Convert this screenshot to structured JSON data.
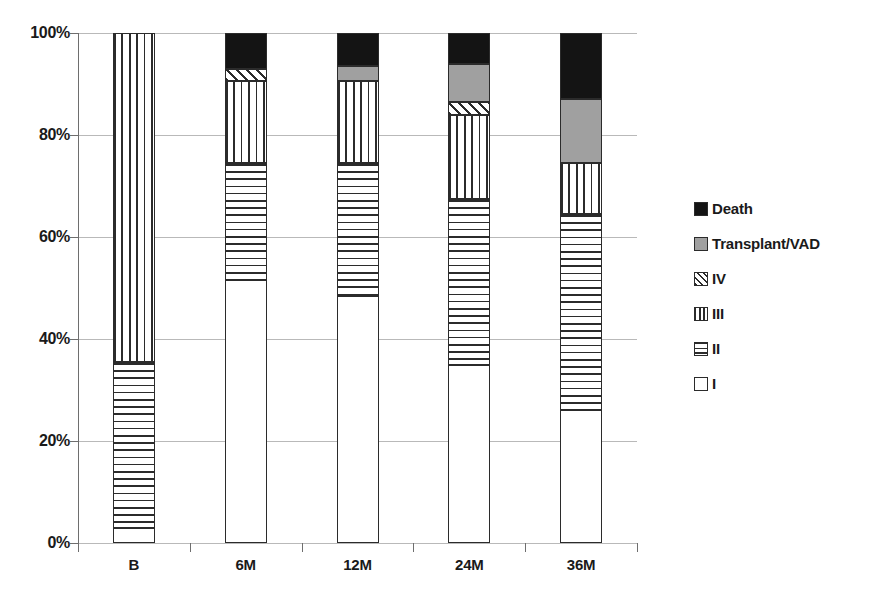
{
  "chart_data": {
    "type": "bar",
    "subtype": "stacked-100-percent",
    "title": "",
    "xlabel": "",
    "ylabel": "",
    "categories": [
      "B",
      "6M",
      "12M",
      "24M",
      "36M"
    ],
    "ylim": [
      0,
      100
    ],
    "ytick_labels": [
      "0%",
      "20%",
      "40%",
      "60%",
      "80%",
      "100%"
    ],
    "ytick_values": [
      0,
      20,
      40,
      60,
      80,
      100
    ],
    "grid": true,
    "legend_position": "right",
    "series": [
      {
        "name": "I",
        "pattern": "solid-white",
        "color": "#ffffff",
        "values": [
          3.0,
          51.5,
          48.5,
          35.0,
          26.0
        ]
      },
      {
        "name": "II",
        "pattern": "horizontal-lines",
        "color": "#ffffff",
        "values": [
          32.5,
          23.0,
          26.0,
          32.5,
          38.5
        ]
      },
      {
        "name": "III",
        "pattern": "vertical-lines",
        "color": "#ffffff",
        "values": [
          64.5,
          16.0,
          16.0,
          16.5,
          10.0
        ]
      },
      {
        "name": "IV",
        "pattern": "diagonal-hatch",
        "color": "#ffffff",
        "values": [
          0.0,
          2.5,
          0.0,
          2.5,
          0.0
        ]
      },
      {
        "name": "Transplant/VAD",
        "pattern": "solid-gray",
        "color": "#a0a0a0",
        "values": [
          0.0,
          0.0,
          3.0,
          7.5,
          12.5
        ]
      },
      {
        "name": "Death",
        "pattern": "solid-black",
        "color": "#141414",
        "values": [
          0.0,
          7.0,
          6.5,
          6.0,
          13.0
        ]
      }
    ]
  },
  "legend": {
    "items": [
      {
        "label": "Death",
        "key": "DEATH"
      },
      {
        "label": "Transplant/VAD",
        "key": "TX"
      },
      {
        "label": "IV",
        "key": "IV"
      },
      {
        "label": "III",
        "key": "III"
      },
      {
        "label": "II",
        "key": "II"
      },
      {
        "label": "I",
        "key": "I"
      }
    ]
  },
  "colors": {
    "death": "#141414",
    "transplant": "#a0a0a0",
    "gridline": "#b9b9b9",
    "axis": "#6e6e6e",
    "stroke": "#2b2b2b"
  }
}
